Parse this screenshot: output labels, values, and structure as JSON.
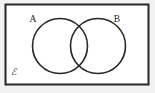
{
  "figure": {
    "width": 155,
    "height": 93,
    "page_background": "#f2f2f2",
    "universe_fill": "#ffffff",
    "stroke_color": "#262626",
    "text_color": "#262626"
  },
  "universe": {
    "label": "ℰ",
    "label_name": "universal-set-symbol",
    "label_x": 11,
    "label_y": 75,
    "rect": {
      "x": 5.5,
      "y": 4.5,
      "width": 143,
      "height": 80,
      "stroke_width": 2
    }
  },
  "sets": [
    {
      "label": "A",
      "cx": 60,
      "cy": 46,
      "r": 27.5,
      "stroke_width": 1.6,
      "label_x": 33,
      "label_y": 22
    },
    {
      "label": "B",
      "cx": 98,
      "cy": 46,
      "r": 27.5,
      "stroke_width": 1.6,
      "label_x": 117,
      "label_y": 22
    }
  ],
  "regions": {
    "intersection_shaded": false,
    "a_only_shaded": false,
    "b_only_shaded": false,
    "outside_shaded": false
  }
}
